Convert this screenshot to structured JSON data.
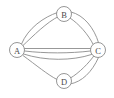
{
  "figure": {
    "type": "graph-diagram",
    "width": 114,
    "height": 98,
    "background_color": "#ffffff",
    "edge_color": "#8c8c8c",
    "node_fill_color": "#ffffff",
    "node_stroke_color": "#8a8a8a",
    "label_color": "#4a4a4a"
  },
  "nodes": [
    {
      "id": "A",
      "label": "A",
      "x": 17,
      "y": 50,
      "r": 7.5
    },
    {
      "id": "B",
      "label": "B",
      "x": 64,
      "y": 14,
      "r": 7.5
    },
    {
      "id": "C",
      "label": "C",
      "x": 98,
      "y": 50,
      "r": 7.5
    },
    {
      "id": "D",
      "label": "D",
      "x": 64,
      "y": 81,
      "r": 7.5
    }
  ],
  "edges": [
    {
      "id": "AB-outer",
      "from": "A",
      "to": "B",
      "name": "edge-a-b-outer",
      "d": "M 21.5 44 C 28 28 44 17 57.5 12.5"
    },
    {
      "id": "AB-inner",
      "from": "A",
      "to": "B",
      "name": "edge-a-b-inner",
      "d": "M 23 45.5 C 33 36 47 22 58.5 16.5"
    },
    {
      "id": "BC-outer",
      "from": "B",
      "to": "C",
      "name": "edge-b-c-outer",
      "d": "M 71 12 C 84 15 94 28 98.5 42.5"
    },
    {
      "id": "BC-inner",
      "from": "B",
      "to": "C",
      "name": "edge-b-c-inner",
      "d": "M 70 18 C 79 24 88 34 93.5 45"
    },
    {
      "id": "AC-top",
      "from": "A",
      "to": "C",
      "name": "edge-a-c-top",
      "d": "M 24.5 48.5 L 90.5 48.5"
    },
    {
      "id": "AC-mid",
      "from": "A",
      "to": "C",
      "name": "edge-a-c-middle",
      "d": "M 24.5 51 C 45 53.5 70 53.5 90.5 51"
    },
    {
      "id": "AC-bot",
      "from": "A",
      "to": "C",
      "name": "edge-a-c-bottom",
      "d": "M 23.5 54 C 45 61 72 61 91.5 54.5"
    },
    {
      "id": "AD",
      "from": "A",
      "to": "D",
      "name": "edge-a-d",
      "d": "M 23 55.5 C 36 65 48 75 57 79.5"
    },
    {
      "id": "DC-inner",
      "from": "D",
      "to": "C",
      "name": "edge-d-c-inner",
      "d": "M 70.5 78 C 79 73 89 63 94.5 55"
    },
    {
      "id": "DC-outer",
      "from": "D",
      "to": "C",
      "name": "edge-d-c-outer",
      "d": "M 70 84 C 82 82 92 72 98.5 57.5"
    }
  ]
}
